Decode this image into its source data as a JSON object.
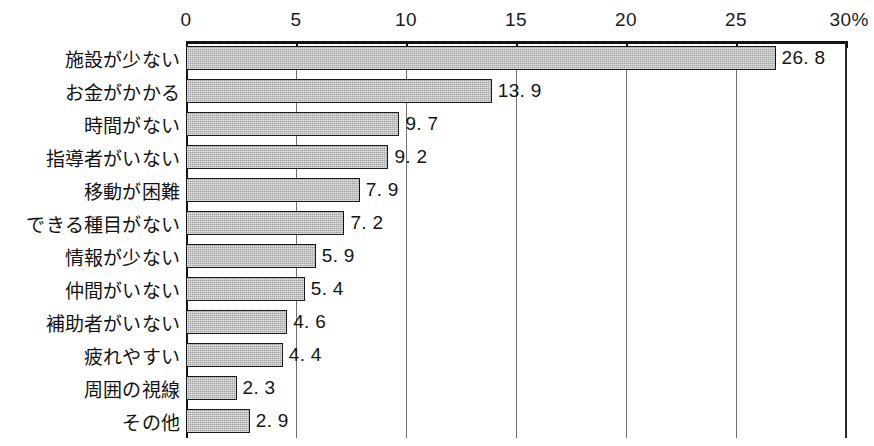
{
  "chart_data": {
    "type": "bar",
    "orientation": "horizontal",
    "title": "",
    "xlabel": "",
    "ylabel": "",
    "xlim": [
      0,
      30
    ],
    "unit_suffix": "%",
    "grid": true,
    "legend": null,
    "axis": {
      "ticks": [
        0,
        5,
        10,
        15,
        20,
        25,
        30
      ],
      "tick_labels": [
        "0",
        "5",
        "10",
        "15",
        "20",
        "25",
        "30%"
      ],
      "position": "top"
    },
    "categories": [
      "施設が少ない",
      "お金がかかる",
      "時間がない",
      "指導者がいない",
      "移動が困難",
      "できる種目がない",
      "情報が少ない",
      "仲間がいない",
      "補助者がいない",
      "疲れやすい",
      "周囲の視線",
      "その他"
    ],
    "values": [
      26.8,
      13.9,
      9.7,
      9.2,
      7.9,
      7.2,
      5.9,
      5.4,
      4.6,
      4.4,
      2.3,
      2.9
    ],
    "value_labels": [
      "26. 8",
      "13. 9",
      "9. 7",
      "9. 2",
      "7. 9",
      "7. 2",
      "5. 9",
      "5. 4",
      "4. 6",
      "4. 4",
      "2. 3",
      "2. 9"
    ],
    "colors": {
      "bar_fill": "#b7b7b7",
      "bar_border": "#1a1a1a",
      "axis": "#141414",
      "gridline": "#707070",
      "text": "#121212",
      "background": "#ffffff"
    }
  }
}
